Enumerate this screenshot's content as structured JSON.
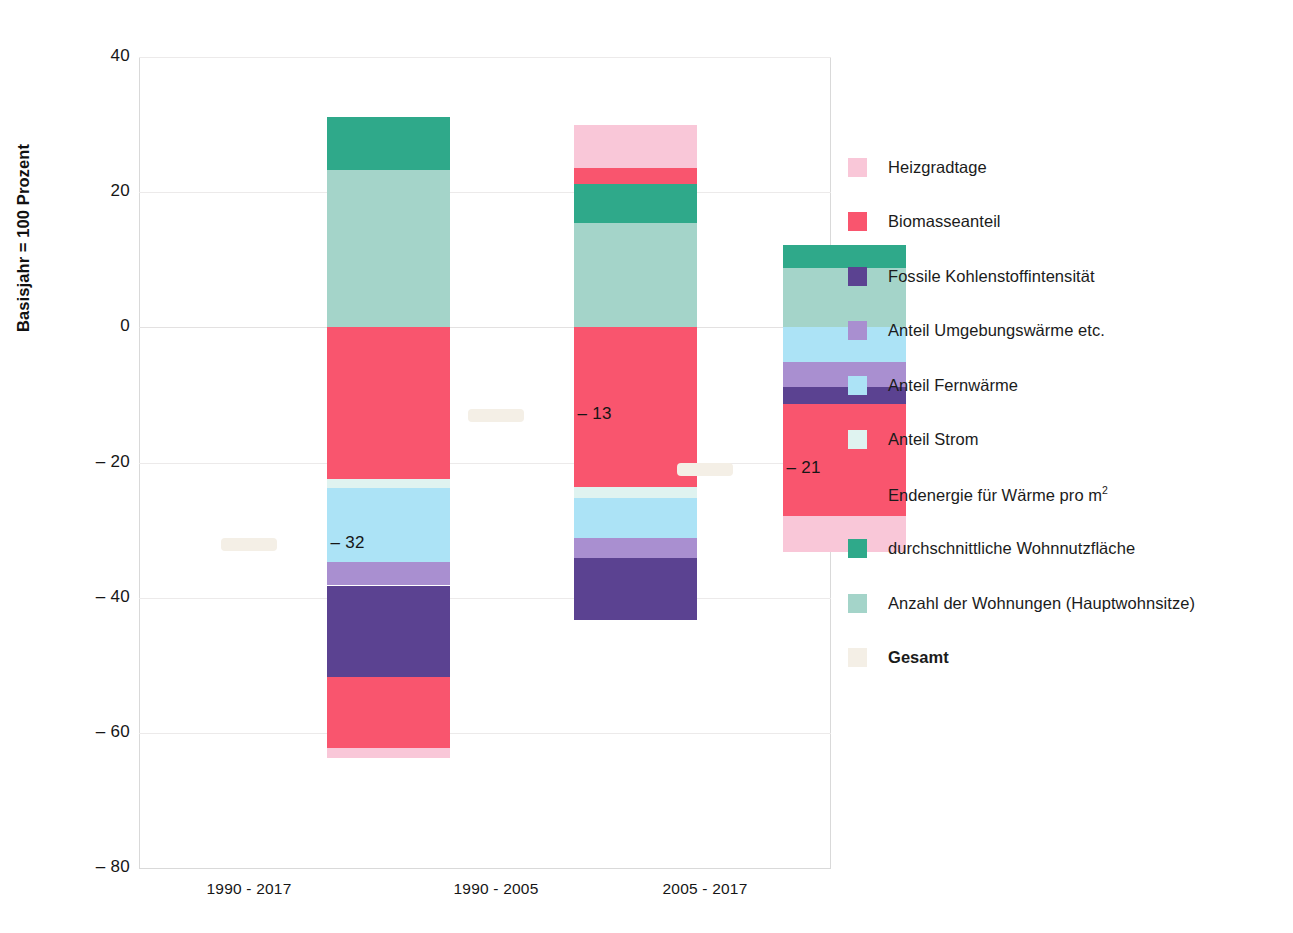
{
  "axis": {
    "y_title": "Basisjahr = 100 Prozent",
    "y_ticks": [
      "40",
      "20",
      "0",
      "– 20",
      "– 40",
      "– 60",
      "– 80"
    ],
    "x_ticks": [
      "1990 - 2017",
      "1990 - 2005",
      "2005 - 2017"
    ]
  },
  "legend": {
    "items": [
      {
        "label": "Heizgradtage",
        "color": "#f9c7d8"
      },
      {
        "label": "Biomasseanteil",
        "color": "#f9556e"
      },
      {
        "label": "Fossile Kohlenstoffintensität",
        "color": "#5b4291"
      },
      {
        "label": "Anteil Umgebungswärme etc.",
        "color": "#a98fd0"
      },
      {
        "label": "Anteil Fernwärme",
        "color": "#ace3f6"
      },
      {
        "label": "Anteil Strom",
        "color": "#dff3f0"
      },
      {
        "label": "Endenergie für Wärme pro m²",
        "color": "#f9556e",
        "sup": "2",
        "base_label": "Endenergie für Wärme pro m"
      },
      {
        "label": "durchschnittliche Wohnnutzfläche",
        "color": "#2fa98a"
      },
      {
        "label": "Anzahl der Wohnungen (Hauptwohnsitze)",
        "color": "#a4d4c9"
      },
      {
        "label": "Gesamt",
        "color": "#f4efe6"
      }
    ]
  },
  "chart_data": {
    "type": "bar",
    "subtype": "stacked-waterfall-decomposition",
    "title": "",
    "xlabel": "",
    "ylabel": "Basisjahr = 100 Prozent",
    "ylim": [
      -80,
      40
    ],
    "ytick_values": [
      40,
      20,
      0,
      -20,
      -40,
      -60,
      -80
    ],
    "grid": true,
    "legend_position": "right",
    "categories": [
      "1990 - 2017",
      "1990 - 2005",
      "2005 - 2017"
    ],
    "totals": [
      -32,
      -13,
      -21
    ],
    "total_labels": [
      "– 32",
      "– 13",
      "– 21"
    ],
    "series": [
      {
        "name": "Heizgradtage",
        "color": "#f9c7d8",
        "values": [
          -1.3,
          6.3,
          -5.2
        ]
      },
      {
        "name": "Biomasseanteil",
        "color": "#f9556e",
        "values": [
          -10.5,
          -1.6,
          -1.3
        ]
      },
      {
        "name": "Fossile Kohlenstoffintensität",
        "color": "#5b4291",
        "values": [
          -13.5,
          -9.0,
          -1.6
        ]
      },
      {
        "name": "Anteil Umgebungswärme etc.",
        "color": "#a98fd0",
        "values": [
          -3.5,
          -2.0,
          -3.1
        ]
      },
      {
        "name": "Anteil Fernwärme",
        "color": "#ace3f6",
        "values": [
          -5.5,
          -5.0,
          -5.2
        ]
      },
      {
        "name": "Anteil Strom",
        "color": "#dff3f0",
        "values": [
          -1.4,
          -1.6,
          0.0
        ]
      },
      {
        "name": "Endenergie für Wärme pro m²",
        "color": "#f9556e",
        "values": [
          -22.4,
          -23.6,
          -11.3
        ]
      },
      {
        "name": "durchschnittliche Wohnnutzfläche",
        "color": "#2fa98a",
        "values": [
          7.8,
          5.7,
          3.4
        ]
      },
      {
        "name": "Anzahl der Wohnungen (Hauptwohnsitze)",
        "color": "#a4d4c9",
        "values": [
          23.3,
          15.5,
          8.8
        ]
      }
    ]
  },
  "bars": [
    {
      "category": "1990 - 2017",
      "total_label": "– 32",
      "segments": [
        {
          "name": "Anzahl der Wohnungen (Hauptwohnsitze)",
          "color": "#a4d4c9",
          "from": 0.0,
          "to": 23.3
        },
        {
          "name": "durchschnittliche Wohnnutzfläche",
          "color": "#2fa98a",
          "from": 23.3,
          "to": 31.1
        },
        {
          "name": "Endenergie für Wärme pro m²",
          "color": "#f9556e",
          "from": 0.0,
          "to": -22.4
        },
        {
          "name": "Anteil Strom",
          "color": "#dff3f0",
          "from": -22.4,
          "to": -23.8
        },
        {
          "name": "Anteil Fernwärme",
          "color": "#ace3f6",
          "from": -23.8,
          "to": -34.7
        },
        {
          "name": "Anteil Umgebungswärme etc.",
          "color": "#a98fd0",
          "from": -34.7,
          "to": -38.2
        },
        {
          "name": "Fossile Kohlenstoffintensität",
          "color": "#5b4291",
          "from": -38.2,
          "to": -51.8
        },
        {
          "name": "Biomasseanteil",
          "color": "#f9556e",
          "from": -51.8,
          "to": -62.3
        },
        {
          "name": "Heizgradtage",
          "color": "#f9c7d8",
          "from": -62.3,
          "to": -63.7
        }
      ]
    },
    {
      "category": "1990 - 2005",
      "total_label": "– 13",
      "segments": [
        {
          "name": "Anzahl der Wohnungen (Hauptwohnsitze)",
          "color": "#a4d4c9",
          "from": 0.0,
          "to": 15.5
        },
        {
          "name": "durchschnittliche Wohnnutzfläche",
          "color": "#2fa98a",
          "from": 15.5,
          "to": 21.2
        },
        {
          "name": "Biomasseanteil",
          "color": "#f9556e",
          "from": 21.2,
          "to": 23.6
        },
        {
          "name": "Heizgradtage",
          "color": "#f9c7d8",
          "from": 23.6,
          "to": 30.0
        },
        {
          "name": "Endenergie für Wärme pro m²",
          "color": "#f9556e",
          "from": 0.0,
          "to": -23.6
        },
        {
          "name": "Anteil Strom",
          "color": "#dff3f0",
          "from": -23.6,
          "to": -25.3
        },
        {
          "name": "Anteil Fernwärme",
          "color": "#ace3f6",
          "from": -25.3,
          "to": -31.2
        },
        {
          "name": "Anteil Umgebungswärme etc.",
          "color": "#a98fd0",
          "from": -31.2,
          "to": -34.1
        },
        {
          "name": "Fossile Kohlenstoffintensität",
          "color": "#5b4291",
          "from": -34.1,
          "to": -43.3
        }
      ]
    },
    {
      "category": "2005 - 2017",
      "total_label": "– 21",
      "segments": [
        {
          "name": "Anzahl der Wohnungen (Hauptwohnsitze)",
          "color": "#a4d4c9",
          "from": 0.0,
          "to": 8.8
        },
        {
          "name": "durchschnittliche Wohnnutzfläche",
          "color": "#2fa98a",
          "from": 8.8,
          "to": 12.2
        },
        {
          "name": "Anteil Fernwärme",
          "color": "#ace3f6",
          "from": 0.0,
          "to": -5.2
        },
        {
          "name": "Anteil Umgebungswärme etc.",
          "color": "#a98fd0",
          "from": -5.2,
          "to": -8.8
        },
        {
          "name": "Fossile Kohlenstoffintensität",
          "color": "#5b4291",
          "from": -8.8,
          "to": -11.3
        },
        {
          "name": "Endenergie für Wärme pro m²",
          "color": "#f9556e",
          "from": -11.3,
          "to": -27.9
        },
        {
          "name": "Heizgradtage",
          "color": "#f9c7d8",
          "from": -27.9,
          "to": -33.2
        }
      ]
    }
  ]
}
